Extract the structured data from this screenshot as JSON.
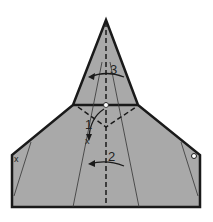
{
  "diagram": {
    "type": "origami-fold-diagram",
    "paper_color": "#a9a9a9",
    "line_color": "#1a1a1a",
    "steps": [
      {
        "label": "1",
        "description": "fold point down to x mark"
      },
      {
        "label": "2",
        "description": "fold left along center"
      },
      {
        "label": "3",
        "description": "fold left along center (top)"
      }
    ],
    "markers": {
      "x_marks": [
        "x",
        "x"
      ],
      "dots": [
        "white dot at center",
        "circle on right edge"
      ]
    }
  }
}
